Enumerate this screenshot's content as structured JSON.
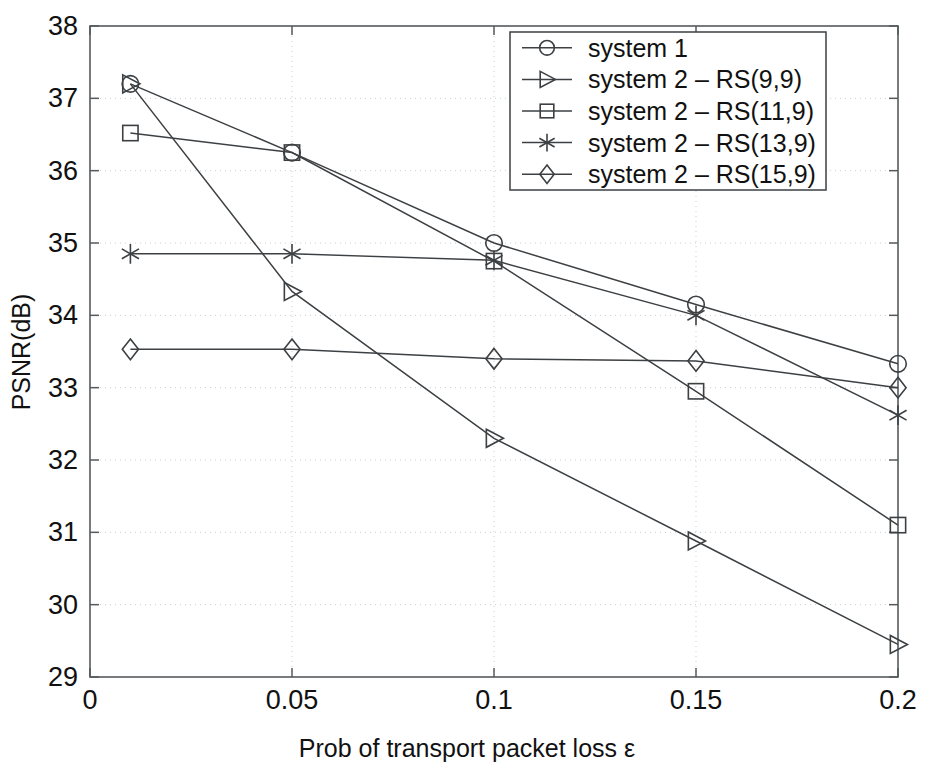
{
  "chart_data": {
    "type": "line",
    "title": "",
    "xlabel": "Prob of transport packet loss ε",
    "ylabel": "PSNR(dB)",
    "xlim": [
      0,
      0.2
    ],
    "ylim": [
      29,
      38
    ],
    "xticks": [
      "0",
      "0.05",
      "0.1",
      "0.15",
      "0.2"
    ],
    "xtick_values": [
      0,
      0.05,
      0.1,
      0.15,
      0.2
    ],
    "yticks": [
      "29",
      "30",
      "31",
      "32",
      "33",
      "34",
      "35",
      "36",
      "37",
      "38"
    ],
    "ytick_values": [
      29,
      30,
      31,
      32,
      33,
      34,
      35,
      36,
      37,
      38
    ],
    "grid": true,
    "legend_position": "top-right",
    "x": [
      0.01,
      0.05,
      0.1,
      0.15,
      0.2
    ],
    "series": [
      {
        "name": "system 1",
        "marker": "circle",
        "values": [
          37.2,
          36.25,
          35.0,
          34.15,
          33.33
        ]
      },
      {
        "name": "system 2 – RS(9,9)",
        "marker": "triangle-right",
        "values": [
          37.2,
          34.33,
          32.3,
          30.88,
          29.45
        ]
      },
      {
        "name": "system 2 – RS(11,9)",
        "marker": "square",
        "values": [
          36.52,
          36.25,
          34.75,
          32.95,
          31.1
        ]
      },
      {
        "name": "system 2 – RS(13,9)",
        "marker": "asterisk",
        "values": [
          34.85,
          34.85,
          34.76,
          34.0,
          32.62
        ]
      },
      {
        "name": "system 2 – RS(15,9)",
        "marker": "diamond",
        "values": [
          33.53,
          33.53,
          33.4,
          33.37,
          33.0
        ]
      }
    ],
    "colors": {
      "line": "#3c4043",
      "axis": "#555a5e",
      "grid": "#c9cdd2",
      "background": "#ffffff",
      "text": "#111111"
    }
  },
  "legend": {
    "entries": [
      "system 1",
      "system 2 – RS(9,9)",
      "system 2 – RS(11,9)",
      "system 2 – RS(13,9)",
      "system 2 – RS(15,9)"
    ]
  },
  "axes": {
    "x_title": "Prob of transport packet loss ε",
    "y_title": "PSNR(dB)",
    "x_tick_labels": [
      "0",
      "0.05",
      "0.1",
      "0.15",
      "0.2"
    ],
    "y_tick_labels": [
      "38",
      "37",
      "36",
      "35",
      "34",
      "33",
      "32",
      "31",
      "30",
      "29"
    ]
  }
}
